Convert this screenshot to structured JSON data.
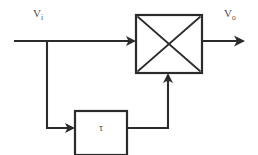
{
  "diagram": {
    "background_color": "#ffffff",
    "line_color": "#2b2b2b",
    "text_color": "#4a4a4a",
    "labels": {
      "input_base": "V",
      "input_subscript": "i",
      "output_base": "V",
      "output_subscript": "o",
      "delay_symbol": "τ"
    },
    "blocks": [
      {
        "name": "mixer",
        "symbol": "X",
        "x": 136,
        "y": 15,
        "width": 66,
        "height": 58
      },
      {
        "name": "delay",
        "symbol": "τ",
        "x": 75,
        "y": 111,
        "width": 52,
        "height": 44
      }
    ],
    "signals": [
      {
        "name": "input-signal",
        "from": "V_i",
        "to": "mixer",
        "direction": "right"
      },
      {
        "name": "branch-signal",
        "from": "input-signal",
        "to": "delay",
        "direction": "down-right"
      },
      {
        "name": "delay-output-signal",
        "from": "delay",
        "to": "mixer",
        "direction": "right-up"
      },
      {
        "name": "output-signal",
        "from": "mixer",
        "to": "V_o",
        "direction": "right"
      }
    ]
  }
}
